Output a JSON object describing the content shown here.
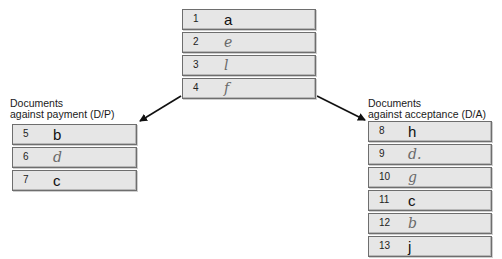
{
  "top_group": {
    "rows": [
      {
        "number": "1",
        "value": "a",
        "handwritten": false
      },
      {
        "number": "2",
        "value": "e",
        "handwritten": true
      },
      {
        "number": "3",
        "value": "l",
        "handwritten": true
      },
      {
        "number": "4",
        "value": "f",
        "handwritten": true
      }
    ]
  },
  "left_group": {
    "label_line1": "Documents",
    "label_line2": "against payment (D/P)",
    "rows": [
      {
        "number": "5",
        "value": "b",
        "handwritten": false
      },
      {
        "number": "6",
        "value": "d",
        "handwritten": true
      },
      {
        "number": "7",
        "value": "c",
        "handwritten": false
      }
    ]
  },
  "right_group": {
    "label_line1": "Documents",
    "label_line2": "against acceptance (D/A)",
    "rows": [
      {
        "number": "8",
        "value": "h",
        "handwritten": false
      },
      {
        "number": "9",
        "value": "d.",
        "handwritten": true
      },
      {
        "number": "10",
        "value": "g",
        "handwritten": true
      },
      {
        "number": "11",
        "value": "c",
        "handwritten": false
      },
      {
        "number": "12",
        "value": "b",
        "handwritten": true
      },
      {
        "number": "13",
        "value": "j",
        "handwritten": false
      }
    ]
  },
  "arrows": [
    {
      "from": "top_group",
      "to": "left_group"
    },
    {
      "from": "top_group",
      "to": "right_group"
    }
  ]
}
